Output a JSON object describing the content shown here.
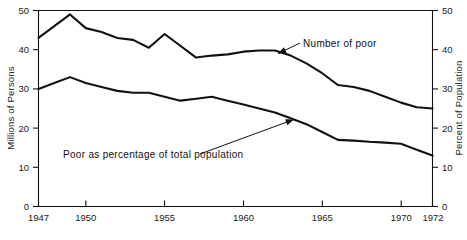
{
  "chart_data": {
    "type": "line",
    "title": "",
    "xlabel": "",
    "ylabel": "Millions of Persons",
    "y2label": "Percent of Population",
    "xlim": [
      1947,
      1972
    ],
    "ylim": [
      0,
      50
    ],
    "y2lim": [
      0,
      50
    ],
    "grid": false,
    "legend": "inline-annotations",
    "xticks": [
      1947,
      1950,
      1955,
      1960,
      1965,
      1970,
      1972
    ],
    "xticklabels": [
      "1947",
      "1950",
      "1955",
      "1960",
      "1965",
      "1970",
      "1972"
    ],
    "yticks": [
      0,
      10,
      20,
      30,
      40,
      50
    ],
    "yticklabels": [
      "0",
      "10",
      "20",
      "30",
      "40",
      "50"
    ],
    "y2ticks": [
      0,
      10,
      20,
      30,
      40,
      50
    ],
    "y2ticklabels": [
      "0",
      "10",
      "20",
      "30",
      "40",
      "50"
    ],
    "x": [
      1947,
      1948,
      1949,
      1950,
      1951,
      1952,
      1953,
      1954,
      1955,
      1956,
      1957,
      1958,
      1959,
      1960,
      1961,
      1962,
      1963,
      1964,
      1965,
      1966,
      1967,
      1968,
      1969,
      1970,
      1971,
      1972
    ],
    "series": [
      {
        "name": "Number of poor",
        "axis": "left",
        "units": "millions",
        "values": [
          43.0,
          46.0,
          49.0,
          45.5,
          44.5,
          43.0,
          42.5,
          40.5,
          44.0,
          41.0,
          38.0,
          38.5,
          38.8,
          39.5,
          39.8,
          39.8,
          38.5,
          36.5,
          34.0,
          31.0,
          30.5,
          29.5,
          28.0,
          26.5,
          25.3,
          25.0
        ]
      },
      {
        "name": "Poor as percentage of total population",
        "axis": "right",
        "units": "percent",
        "values": [
          30.0,
          31.5,
          33.0,
          31.5,
          30.5,
          29.5,
          29.0,
          29.0,
          28.0,
          27.0,
          27.5,
          28.0,
          27.0,
          26.0,
          25.0,
          24.0,
          22.5,
          21.0,
          19.0,
          17.0,
          16.8,
          16.5,
          16.3,
          16.0,
          14.5,
          13.0
        ]
      }
    ],
    "annotations": [
      {
        "text": "Number of poor",
        "target_x": 1962.2,
        "target_y": 39.0,
        "series": "Number of poor"
      },
      {
        "text": "Poor as percentage of total population",
        "target_x": 1963.2,
        "target_y": 22.2,
        "series": "Poor as percentage of total population"
      }
    ]
  },
  "axes": {
    "left_title": "Millions of Persons",
    "right_title": "Percent of Population"
  }
}
